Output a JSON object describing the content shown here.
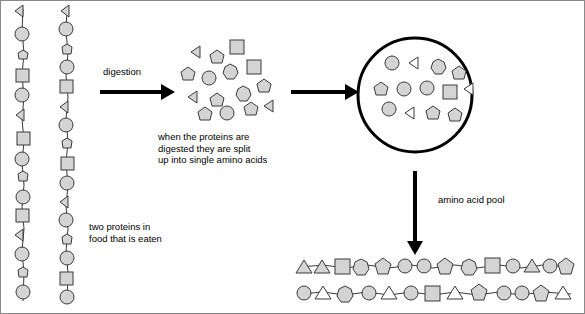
{
  "diagram": {
    "labels": {
      "digestion": "digestion",
      "split_text": "when the proteins are\ndigested they are split\nup into single amino acids",
      "two_proteins": "two proteins in\nfood that is eaten",
      "amino_acid_pool": "amino acid pool"
    },
    "left_chains": [
      {
        "name": "protein-chain-1",
        "x": 22,
        "y_start": 8,
        "y_end": 300,
        "units": [
          "triangle",
          "circle",
          "heptagon",
          "square",
          "circle",
          "triangle",
          "square",
          "circle",
          "heptagon",
          "circle",
          "square",
          "triangle",
          "circle",
          "heptagon",
          "circle",
          "square",
          "triangle",
          "circle",
          "heptagon",
          "circle",
          "triangle",
          "square",
          "circle",
          "heptagon"
        ]
      },
      {
        "name": "protein-chain-2",
        "x": 67,
        "y_start": 8,
        "y_end": 300,
        "units": [
          "triangle",
          "circle",
          "heptagon",
          "circle",
          "square",
          "triangle",
          "circle",
          "heptagon",
          "square",
          "circle",
          "triangle",
          "circle",
          "heptagon",
          "circle",
          "square",
          "triangle",
          "circle",
          "heptagon",
          "circle",
          "triangle",
          "square",
          "circle",
          "heptagon",
          "circle"
        ]
      }
    ],
    "free_amino_acids": [
      {
        "shape": "triangle",
        "x": 195,
        "y": 50
      },
      {
        "shape": "pentagon",
        "x": 214,
        "y": 56
      },
      {
        "shape": "square",
        "x": 236,
        "y": 46
      },
      {
        "shape": "pentagon",
        "x": 185,
        "y": 73
      },
      {
        "shape": "circle",
        "x": 207,
        "y": 77
      },
      {
        "shape": "heptagon",
        "x": 228,
        "y": 70
      },
      {
        "shape": "square",
        "x": 252,
        "y": 65
      },
      {
        "shape": "triangle",
        "x": 192,
        "y": 95
      },
      {
        "shape": "pentagon",
        "x": 214,
        "y": 99
      },
      {
        "shape": "heptagon",
        "x": 240,
        "y": 92
      },
      {
        "shape": "pentagon",
        "x": 261,
        "y": 85
      },
      {
        "shape": "pentagon",
        "x": 202,
        "y": 113
      },
      {
        "shape": "circle",
        "x": 225,
        "y": 112
      },
      {
        "shape": "pentagon",
        "x": 248,
        "y": 108
      },
      {
        "shape": "triangle",
        "x": 268,
        "y": 104
      }
    ],
    "pool_circle": {
      "cx": 414,
      "cy": 94,
      "r": 57
    },
    "pool_amino_acids": [
      {
        "shape": "circle",
        "x": 390,
        "y": 62
      },
      {
        "shape": "triangle",
        "x": 412,
        "y": 62
      },
      {
        "shape": "heptagon",
        "x": 436,
        "y": 64
      },
      {
        "shape": "pentagon",
        "x": 456,
        "y": 70
      },
      {
        "shape": "pentagon",
        "x": 378,
        "y": 86
      },
      {
        "shape": "circle",
        "x": 401,
        "y": 88
      },
      {
        "shape": "circle",
        "x": 424,
        "y": 87
      },
      {
        "shape": "square",
        "x": 448,
        "y": 90
      },
      {
        "shape": "triangle",
        "x": 468,
        "y": 88
      },
      {
        "shape": "circle",
        "x": 386,
        "y": 108
      },
      {
        "shape": "triangle",
        "x": 408,
        "y": 112
      },
      {
        "shape": "pentagon",
        "x": 430,
        "y": 110
      },
      {
        "shape": "pentagon",
        "x": 452,
        "y": 112
      }
    ],
    "bottom_chains": [
      {
        "name": "new-protein-chain-1",
        "x_start": 300,
        "x_end": 570,
        "y": 266,
        "units": [
          "triangle",
          "triangle",
          "square",
          "heptagon",
          "pentagon",
          "circle",
          "circle",
          "pentagon",
          "heptagon",
          "square",
          "circle",
          "triangle",
          "circle",
          "pentagon",
          "circle",
          "square"
        ]
      },
      {
        "name": "new-protein-chain-2",
        "x_start": 300,
        "x_end": 570,
        "y": 293,
        "units": [
          "circle",
          "triangle",
          "heptagon",
          "circle",
          "triangle",
          "circle",
          "square",
          "triangle",
          "pentagon",
          "circle",
          "circle",
          "pentagon",
          "triangle",
          "circle",
          "square"
        ]
      }
    ],
    "arrows": [
      {
        "name": "digestion-arrow",
        "x1": 99,
        "y1": 91,
        "x2": 165,
        "y2": 91,
        "dir": "right"
      },
      {
        "name": "absorption-arrow",
        "x1": 290,
        "y1": 91,
        "x2": 348,
        "y2": 91,
        "dir": "right"
      },
      {
        "name": "pool-to-protein-arrow",
        "x1": 414,
        "y1": 170,
        "x2": 414,
        "y2": 245,
        "dir": "down"
      }
    ],
    "colors": {
      "shape_fill": "#d4d4d4",
      "shape_stroke": "#3a3a3a",
      "arrow": "#000000",
      "border": "#8a8a8a",
      "background": "#ffffff"
    }
  }
}
